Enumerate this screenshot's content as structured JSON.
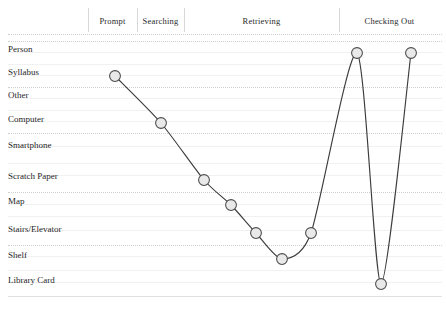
{
  "chart_data": {
    "type": "line",
    "title": "",
    "subtitle": "",
    "xlabel": "",
    "ylabel": "",
    "grid": true,
    "legend_position": "none",
    "categories": [
      "Prompt",
      "Searching",
      "Retrieving",
      "Checking Out"
    ],
    "y_categories": [
      "Person",
      "Syllabus",
      "Other",
      "Computer",
      "Smartphone",
      "Scratch Paper",
      "Map",
      "Stairs/Elevator",
      "Shelf",
      "Library Card"
    ],
    "ylim": [
      0,
      9
    ],
    "series": [
      {
        "name": "Resource touchpoints",
        "points": [
          {
            "x": 115,
            "y_label": "Syllabus",
            "y_index": 1,
            "phase": "Prompt"
          },
          {
            "x": 161,
            "y_label": "Computer",
            "y_index": 3,
            "phase": "Searching"
          },
          {
            "x": 204,
            "y_label": "Scratch Paper",
            "y_index": 5,
            "phase": "Retrieving"
          },
          {
            "x": 231,
            "y_label": "Map",
            "y_index": 6,
            "phase": "Retrieving"
          },
          {
            "x": 256,
            "y_label": "Stairs/Elevator",
            "y_index": 7,
            "phase": "Retrieving"
          },
          {
            "x": 282,
            "y_label": "Shelf",
            "y_index": 8,
            "phase": "Retrieving"
          },
          {
            "x": 311,
            "y_label": "Stairs/Elevator",
            "y_index": 7,
            "phase": "Retrieving"
          },
          {
            "x": 357,
            "y_label": "Person",
            "y_index": 0,
            "phase": "Checking Out"
          },
          {
            "x": 381,
            "y_label": "Library Card",
            "y_index": 9,
            "phase": "Checking Out"
          },
          {
            "x": 411,
            "y_label": "Person",
            "y_index": 0,
            "phase": "Checking Out"
          }
        ]
      }
    ],
    "colors": {
      "line": "#3c3c3c",
      "marker_fill": "#e9e9e9",
      "marker_stroke": "#4a4a4a",
      "gridline": "#cfcfcf",
      "separator": "#d8d8d8",
      "text": "#1f1f1f",
      "background": "#ffffff"
    }
  },
  "phases": [
    {
      "label": "Prompt",
      "center_x": 114,
      "start_x": 88,
      "end_x": 137
    },
    {
      "label": "Searching",
      "center_x": 168,
      "start_x": 137,
      "end_x": 184
    },
    {
      "label": "Retrieving",
      "center_x": 262,
      "start_x": 184,
      "end_x": 339
    },
    {
      "label": "Checking Out",
      "center_x": 389,
      "start_x": 339,
      "end_x": 440
    }
  ],
  "rows": [
    {
      "label": "Person",
      "text_y": 53,
      "grid_y": 41
    },
    {
      "label": "Syllabus",
      "text_y": 76,
      "grid_y": 64
    },
    {
      "label": "Other",
      "text_y": 99,
      "grid_y": 87
    },
    {
      "label": "Computer",
      "text_y": 123,
      "grid_y": 110
    },
    {
      "label": "Smartphone",
      "text_y": 149,
      "grid_y": 133
    },
    {
      "label": "Scratch Paper",
      "text_y": 180,
      "grid_y": 163
    },
    {
      "label": "Map",
      "text_y": 205,
      "grid_y": 192
    },
    {
      "label": "Stairs/Elevator",
      "text_y": 233,
      "grid_y": 216
    },
    {
      "label": "Shelf",
      "text_y": 259,
      "grid_y": 245
    },
    {
      "label": "Library Card",
      "text_y": 284,
      "grid_y": 270
    }
  ]
}
